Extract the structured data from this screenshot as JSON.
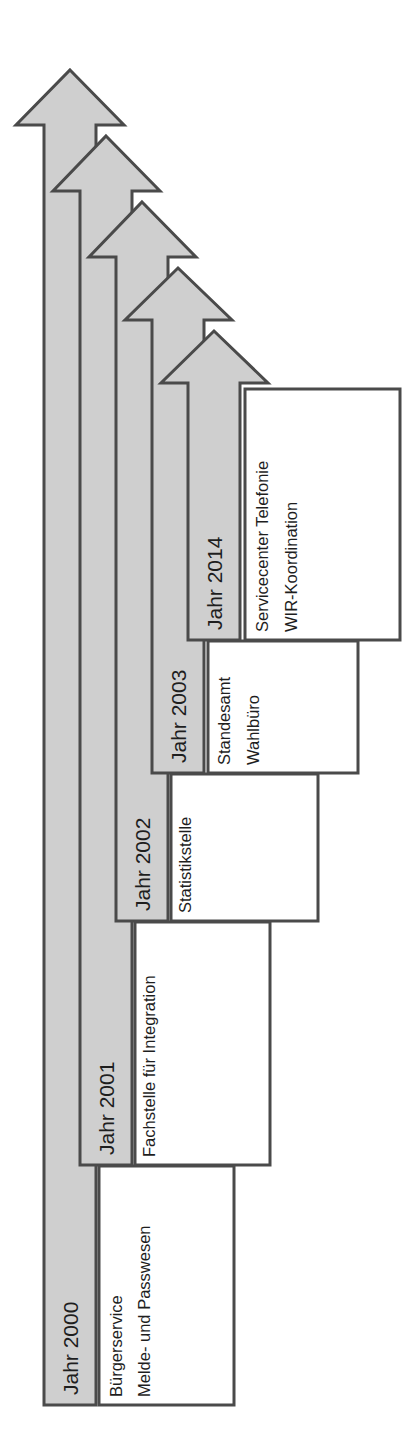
{
  "colors": {
    "arrow_fill": "#cfcfcf",
    "stroke": "#4a4a4a",
    "box_fill": "#ffffff",
    "text": "#1e1e1e"
  },
  "timeline": [
    {
      "year_label": "Jahr 2000",
      "units": [
        "Bürgerservice",
        "Melde- und Passwesen"
      ]
    },
    {
      "year_label": "Jahr 2001",
      "units": [
        "Fachstelle für Integration"
      ]
    },
    {
      "year_label": "Jahr 2002",
      "units": [
        "Statistikstelle"
      ]
    },
    {
      "year_label": "Jahr 2003",
      "units": [
        "Standesamt",
        "Wahlbüro"
      ]
    },
    {
      "year_label": "Jahr 2014",
      "units": [
        "Servicecenter Telefonie",
        "WIR-Koordination"
      ]
    }
  ]
}
